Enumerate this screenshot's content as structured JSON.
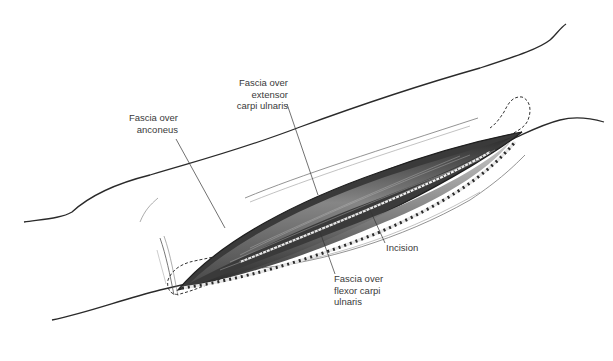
{
  "diagram": {
    "colors": {
      "outline": "#2a2a2a",
      "text": "#3a3a3a",
      "wound_dark": "#2b2b2b",
      "wound_mid": "#7a7a7a",
      "wound_light": "#c9c9c9",
      "background": "#ffffff"
    },
    "labels": {
      "ecu": {
        "lines": [
          "Fascia over",
          "extensor",
          "carpi ulnaris"
        ]
      },
      "anconeus": {
        "lines": [
          "Fascia over",
          "anconeus"
        ]
      },
      "incision": {
        "lines": [
          "Incision"
        ]
      },
      "fcu": {
        "lines": [
          "Fascia over",
          "flexor carpi",
          "ulnaris"
        ]
      }
    }
  }
}
